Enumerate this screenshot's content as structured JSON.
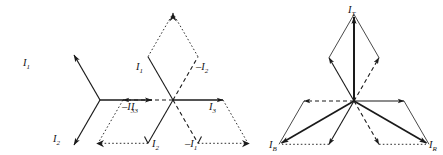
{
  "figure": {
    "background_color": "#ffffff",
    "line_color": "#1a1a1a",
    "width": 443,
    "height": 155,
    "diagrams": [
      {
        "name": "three-phase-star-phasors",
        "center": [
          100,
          100
        ],
        "labels": [
          {
            "id": "d1-l1",
            "base": "I",
            "sub": "1",
            "sign": "",
            "x": 23,
            "y": 66
          },
          {
            "id": "d1-l2",
            "base": "I",
            "sub": "2",
            "sign": "",
            "x": 53,
            "y": 142
          },
          {
            "id": "d1-l3",
            "base": "I",
            "sub": "3",
            "sign": "",
            "x": 79,
            "y": 110
          }
        ],
        "vectors": [
          {
            "name": "I1",
            "angle_deg": 120,
            "style": "solid",
            "arrow": true
          },
          {
            "name": "I2",
            "angle_deg": 240,
            "style": "solid",
            "arrow": true
          },
          {
            "name": "I3",
            "angle_deg": 0,
            "style": "solid",
            "arrow": true
          }
        ]
      },
      {
        "name": "six-phasor-parallelogram-construction",
        "center": [
          173,
          100
        ],
        "labels": [
          {
            "id": "d2-l1",
            "base": "I",
            "sub": "1",
            "sign": "",
            "x": 147,
            "y": 70
          },
          {
            "id": "d2-nl2",
            "base": "I",
            "sub": "2",
            "sign": "–",
            "x": 196,
            "y": 70
          },
          {
            "id": "d2-nl3",
            "base": "I",
            "sub": "3",
            "sign": "–",
            "x": 125,
            "y": 109
          },
          {
            "id": "d2-l3",
            "base": "I",
            "sub": "3",
            "sign": "",
            "x": 214,
            "y": 109
          },
          {
            "id": "d2-l2",
            "base": "I",
            "sub": "2",
            "sign": "",
            "x": 155,
            "y": 145
          },
          {
            "id": "d2-nl1",
            "base": "I",
            "sub": "1",
            "sign": "–",
            "x": 192,
            "y": 145
          }
        ],
        "vectors": [
          {
            "name": "I1",
            "angle_deg": 120,
            "style": "solid",
            "arrow": false
          },
          {
            "name": "-I2",
            "angle_deg": 60,
            "style": "dashed",
            "arrow": false
          },
          {
            "name": "-I3",
            "angle_deg": 180,
            "style": "dashed",
            "arrow": true
          },
          {
            "name": "I3",
            "angle_deg": 0,
            "style": "solid",
            "arrow": true
          },
          {
            "name": "I2",
            "angle_deg": 240,
            "style": "solid",
            "arrow": false
          },
          {
            "name": "-I1",
            "angle_deg": 300,
            "style": "dashed",
            "arrow": false
          }
        ],
        "resultants": [
          {
            "name": "top-resultant",
            "to_angle_deg": 90,
            "arrow": true
          },
          {
            "name": "bottom-left-resultant",
            "to_angle_deg": 210,
            "arrow": true
          },
          {
            "name": "bottom-right-resultant",
            "to_angle_deg": 330,
            "arrow": true
          }
        ]
      },
      {
        "name": "resultant-line-current-phasors",
        "center": [
          354,
          101
        ],
        "labels": [
          {
            "id": "d3-lt",
            "base": "I",
            "sub": "T",
            "sign": "",
            "x": 348,
            "y": 14
          },
          {
            "id": "d3-lb-left",
            "base": "I",
            "sub": "B",
            "sign": "",
            "x": 273,
            "y": 146
          },
          {
            "id": "d3-lb-right",
            "base": "I",
            "sub": "R",
            "sign": "",
            "x": 428,
            "y": 146
          }
        ],
        "vectors": [
          {
            "name": "upper-left",
            "angle_deg": 120,
            "style": "solid",
            "arrow": true
          },
          {
            "name": "upper-right-dashed",
            "angle_deg": 60,
            "style": "dashed",
            "arrow": true
          },
          {
            "name": "left-dashed",
            "angle_deg": 180,
            "style": "dashed",
            "arrow": true
          },
          {
            "name": "right-solid",
            "angle_deg": 0,
            "style": "solid",
            "arrow": true
          },
          {
            "name": "lower-left",
            "angle_deg": 240,
            "style": "solid",
            "arrow": true
          },
          {
            "name": "lower-right-dashed",
            "angle_deg": 300,
            "style": "dashed",
            "arrow": true
          }
        ],
        "resultants": [
          {
            "name": "resultant-IT",
            "to_angle_deg": 90,
            "arrow": true
          },
          {
            "name": "resultant-IB",
            "to_angle_deg": 210,
            "arrow": true
          },
          {
            "name": "resultant-IR",
            "to_angle_deg": 330,
            "arrow": true
          }
        ]
      }
    ]
  }
}
